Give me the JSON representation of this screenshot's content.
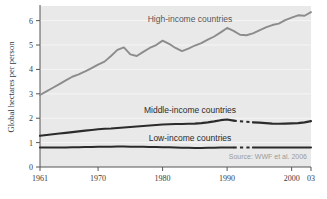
{
  "figure": {
    "background_color": "#ffffff",
    "plot_background_color": "#e9e9e9",
    "gridline_color": "#f5f5f5",
    "axis_color": "#555555",
    "source_note": "Source: WWF et al. 2006"
  },
  "axes": {
    "y_title": "Global hectares per person",
    "y_ticks": [
      "0",
      "1",
      "2",
      "3",
      "4",
      "5",
      "6"
    ],
    "y_tick_values": [
      0,
      1,
      2,
      3,
      4,
      5,
      6
    ],
    "x_ticks": [
      "1961",
      "1970",
      "1980",
      "1990",
      "2000",
      "03"
    ],
    "x_tick_values": [
      1961,
      1970,
      1980,
      1990,
      2000,
      2003
    ]
  },
  "labels": {
    "high": "High-income countries",
    "middle": "Middle-income countries",
    "low": "Low-income countries"
  },
  "chart_data": {
    "type": "line",
    "title": "",
    "subtitle": "",
    "xlabel": "",
    "ylabel": "Global hectares per person",
    "xlim": [
      1961,
      2003
    ],
    "ylim": [
      0,
      6.6
    ],
    "grid": true,
    "legend": "inline-labels",
    "annotations": [
      "Source: WWF et al. 2006"
    ],
    "x": [
      1961,
      1962,
      1963,
      1964,
      1965,
      1966,
      1967,
      1968,
      1969,
      1970,
      1971,
      1972,
      1973,
      1974,
      1975,
      1976,
      1977,
      1978,
      1979,
      1980,
      1981,
      1982,
      1983,
      1984,
      1985,
      1986,
      1987,
      1988,
      1989,
      1990,
      1991,
      1992,
      1993,
      1994,
      1995,
      1996,
      1997,
      1998,
      1999,
      2000,
      2001,
      2002,
      2003
    ],
    "series": [
      {
        "name": "High-income countries",
        "color": "#8c8c8c",
        "values": [
          2.95,
          3.1,
          3.25,
          3.4,
          3.55,
          3.7,
          3.8,
          3.92,
          4.05,
          4.2,
          4.32,
          4.55,
          4.8,
          4.9,
          4.62,
          4.55,
          4.72,
          4.88,
          5.0,
          5.18,
          5.05,
          4.88,
          4.75,
          4.85,
          4.98,
          5.08,
          5.22,
          5.35,
          5.52,
          5.7,
          5.58,
          5.42,
          5.4,
          5.48,
          5.6,
          5.72,
          5.82,
          5.88,
          6.02,
          6.12,
          6.22,
          6.2,
          6.35
        ],
        "dashed_gap": null
      },
      {
        "name": "Middle-income countries",
        "color": "#2b2b2b",
        "values": [
          1.28,
          1.31,
          1.34,
          1.37,
          1.4,
          1.43,
          1.46,
          1.49,
          1.52,
          1.55,
          1.57,
          1.58,
          1.6,
          1.62,
          1.64,
          1.66,
          1.68,
          1.7,
          1.72,
          1.74,
          1.75,
          1.76,
          1.76,
          1.77,
          1.78,
          1.8,
          1.83,
          1.87,
          1.92,
          1.95,
          1.9,
          1.86,
          1.84,
          1.83,
          1.82,
          1.8,
          1.78,
          1.77,
          1.78,
          1.79,
          1.8,
          1.83,
          1.88
        ],
        "dashed_gap": [
          1991,
          1994
        ]
      },
      {
        "name": "Low-income countries",
        "color": "#2b2b2b",
        "values": [
          0.8,
          0.8,
          0.8,
          0.8,
          0.8,
          0.81,
          0.81,
          0.82,
          0.82,
          0.83,
          0.83,
          0.83,
          0.84,
          0.84,
          0.83,
          0.83,
          0.83,
          0.82,
          0.82,
          0.81,
          0.81,
          0.8,
          0.79,
          0.79,
          0.78,
          0.78,
          0.79,
          0.79,
          0.8,
          0.8,
          0.8,
          0.8,
          0.8,
          0.8,
          0.8,
          0.8,
          0.8,
          0.8,
          0.8,
          0.8,
          0.8,
          0.8,
          0.8
        ],
        "dashed_gap": [
          1991,
          1994
        ]
      }
    ]
  }
}
